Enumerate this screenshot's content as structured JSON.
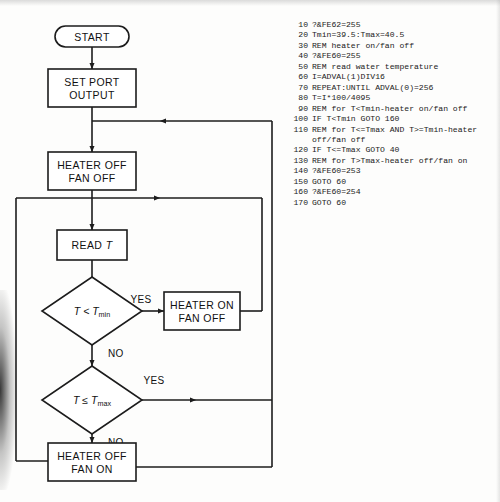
{
  "flowchart": {
    "title": "Water temperature heater/fan control flowchart",
    "nodes": {
      "start": "START",
      "set_port_line1": "SET PORT",
      "set_port_line2": "OUTPUT",
      "heater_off_fan_off_line1": "HEATER OFF",
      "heater_off_fan_off_line2": "FAN OFF",
      "read_t_prefix": "READ ",
      "read_t_var": "T",
      "decision1_var": "T",
      "decision1_op": " < ",
      "decision1_target": "T",
      "decision1_sub": "min",
      "decision2_var": "T",
      "decision2_op": " ≤ ",
      "decision2_target": "T",
      "decision2_sub": "max",
      "heater_on_fan_off_line1": "HEATER ON",
      "heater_on_fan_off_line2": "FAN OFF",
      "heater_off_fan_on_line1": "HEATER OFF",
      "heater_off_fan_on_line2": "FAN ON"
    },
    "branches": {
      "d1_yes": "YES",
      "d1_no": "NO",
      "d2_yes": "YES",
      "d2_no": "NO"
    },
    "colors": {
      "stroke": "#1c1c1c",
      "fill": "#ffffff",
      "text": "#111111"
    }
  },
  "code": {
    "language": "BBC BASIC",
    "lines": [
      {
        "number": "10",
        "source": "?&FE62=255"
      },
      {
        "number": "20",
        "source": "Tmin=39.5:Tmax=40.5"
      },
      {
        "number": "30",
        "source": "REM heater on/fan off"
      },
      {
        "number": "40",
        "source": "?&FE60=255"
      },
      {
        "number": "50",
        "source": "REM read water temperature"
      },
      {
        "number": "60",
        "source": "I=ADVAL(1)DIV16"
      },
      {
        "number": "70",
        "source": "REPEAT:UNTIL ADVAL(0)=256"
      },
      {
        "number": "80",
        "source": "T=I*100/4095"
      },
      {
        "number": "90",
        "source": "REM for T<Tmin-heater on/fan off"
      },
      {
        "number": "100",
        "source": "IF T<Tmin GOTO 160"
      },
      {
        "number": "110",
        "source": "REM for T<=Tmax AND T>=Tmin-heater"
      },
      {
        "number": "",
        "source": "off/fan off"
      },
      {
        "number": "120",
        "source": "IF T<=Tmax GOTO 40"
      },
      {
        "number": "130",
        "source": "REM for T>Tmax-heater off/fan on"
      },
      {
        "number": "140",
        "source": "?&FE60=253"
      },
      {
        "number": "150",
        "source": "GOTO 60"
      },
      {
        "number": "160",
        "source": "?&FE60=254"
      },
      {
        "number": "170",
        "source": "GOTO 60"
      }
    ]
  }
}
